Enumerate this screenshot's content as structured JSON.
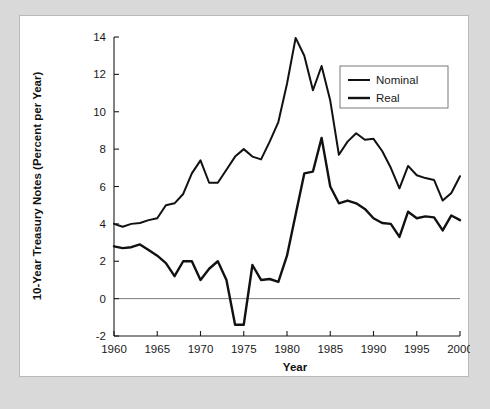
{
  "figure": {
    "background_color": "#d9d9d9",
    "panel_color": "#ffffff",
    "border_color": "#b9b9b9"
  },
  "chart_data": {
    "type": "line",
    "title": "",
    "xlabel": "Year",
    "ylabel": "10-Year Treasury Notes (Percent per Year)",
    "xlim": [
      1960,
      2000
    ],
    "ylim": [
      -2,
      14
    ],
    "xticks": [
      1960,
      1965,
      1970,
      1975,
      1980,
      1985,
      1990,
      1995,
      2000
    ],
    "xtick_labels": [
      "1960",
      "1965",
      "1970",
      "1975",
      "1980",
      "1985",
      "1990",
      "1995",
      "2000"
    ],
    "yticks": [
      -2,
      0,
      2,
      4,
      6,
      8,
      10,
      12,
      14
    ],
    "ytick_labels": [
      "-2",
      "0",
      "2",
      "4",
      "6",
      "8",
      "10",
      "12",
      "14"
    ],
    "grid": false,
    "zero_line": true,
    "legend_position": "upper right",
    "x": [
      1960,
      1961,
      1962,
      1963,
      1964,
      1965,
      1966,
      1967,
      1968,
      1969,
      1970,
      1971,
      1972,
      1973,
      1974,
      1975,
      1976,
      1977,
      1978,
      1979,
      1980,
      1981,
      1982,
      1983,
      1984,
      1985,
      1986,
      1987,
      1988,
      1989,
      1990,
      1991,
      1992,
      1993,
      1994,
      1995,
      1996,
      1997,
      1998,
      1999,
      2000
    ],
    "series": [
      {
        "name": "Nominal",
        "color": "#111111",
        "line_width": 2.0,
        "values": [
          4.0,
          3.85,
          4.0,
          4.05,
          4.2,
          4.3,
          5.0,
          5.1,
          5.6,
          6.7,
          7.4,
          6.2,
          6.2,
          6.9,
          7.6,
          8.0,
          7.6,
          7.45,
          8.4,
          9.45,
          11.5,
          13.95,
          13.0,
          11.15,
          12.45,
          10.6,
          7.7,
          8.4,
          8.85,
          8.5,
          8.55,
          7.9,
          7.0,
          5.9,
          7.1,
          6.6,
          6.45,
          6.35,
          5.25,
          5.65,
          6.55
        ]
      },
      {
        "name": "Real",
        "color": "#111111",
        "line_width": 2.4,
        "values": [
          2.8,
          2.7,
          2.75,
          2.9,
          2.6,
          2.3,
          1.9,
          1.2,
          2.0,
          2.0,
          1.0,
          1.6,
          2.0,
          1.0,
          -1.4,
          -1.4,
          1.8,
          1.0,
          1.05,
          0.9,
          2.3,
          4.5,
          6.7,
          6.8,
          8.6,
          6.0,
          5.1,
          5.25,
          5.1,
          4.8,
          4.3,
          4.05,
          4.0,
          3.3,
          4.65,
          4.3,
          4.4,
          4.35,
          3.65,
          4.45,
          4.2
        ]
      }
    ]
  },
  "legend": {
    "entries": [
      {
        "label": "Nominal"
      },
      {
        "label": "Real"
      }
    ]
  }
}
